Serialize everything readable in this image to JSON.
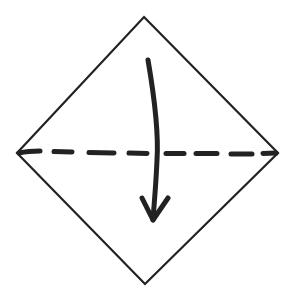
{
  "diagram": {
    "type": "origami-fold-step",
    "description": "Square paper oriented as diamond; valley fold along horizontal diagonal, fold top corner down",
    "colors": {
      "background": "#ffffff",
      "stroke": "#222222"
    },
    "paper": {
      "shape": "diamond",
      "vertices": {
        "top": [
          144,
          17
        ],
        "right": [
          278,
          153
        ],
        "bottom": [
          145,
          284
        ],
        "left": [
          17,
          153
        ]
      }
    },
    "fold_line": {
      "style": "dashed",
      "kind": "valley-fold",
      "from": [
        17,
        153
      ],
      "to": [
        278,
        153
      ]
    },
    "arrow": {
      "direction": "down",
      "start": [
        148,
        60
      ],
      "end": [
        153,
        222
      ],
      "meaning": "fold top corner down to bottom"
    }
  }
}
